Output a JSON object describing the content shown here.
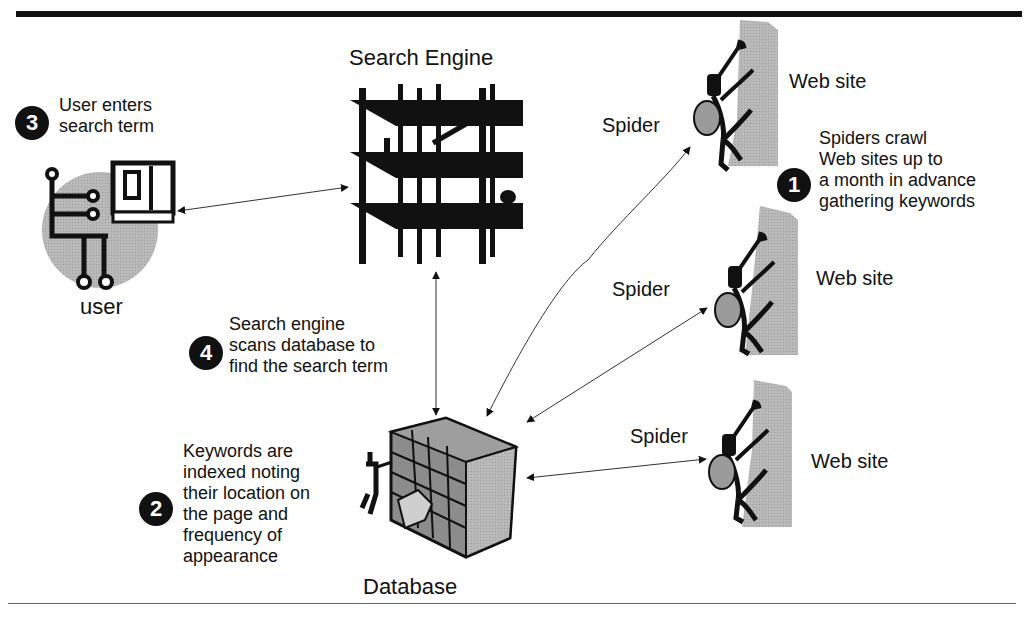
{
  "diagram": {
    "title_nodes": {
      "search_engine": "Search Engine",
      "user": "user",
      "database": "Database"
    },
    "websites": [
      {
        "site_label": "Web site",
        "spider_label": "Spider"
      },
      {
        "site_label": "Web site",
        "spider_label": "Spider"
      },
      {
        "site_label": "Web site",
        "spider_label": "Spider"
      }
    ],
    "steps": [
      {
        "number": "1",
        "lines": [
          "Spiders crawl",
          "Web sites up to",
          "a month in advance",
          "gathering keywords"
        ]
      },
      {
        "number": "2",
        "lines": [
          "Keywords are",
          "indexed noting",
          "their location on",
          "the page and",
          "frequency of",
          "appearance"
        ]
      },
      {
        "number": "3",
        "lines": [
          "User enters",
          "search term"
        ]
      },
      {
        "number": "4",
        "lines": [
          "Search engine",
          "scans database to",
          "find the search term"
        ]
      }
    ],
    "connections": [
      {
        "from": "user",
        "to": "search_engine",
        "type": "bidirectional"
      },
      {
        "from": "search_engine",
        "to": "database",
        "type": "bidirectional"
      },
      {
        "from": "database",
        "to": "spider_1",
        "type": "bidirectional"
      },
      {
        "from": "database",
        "to": "spider_2",
        "type": "bidirectional"
      },
      {
        "from": "database",
        "to": "spider_3",
        "type": "bidirectional"
      }
    ],
    "icons": {
      "user": "computer-user-icon",
      "search_engine": "building-under-construction-icon",
      "spider": "climber-icon",
      "website": "cliff-wall-icon",
      "database": "filing-cabinet-icon"
    },
    "colors": {
      "ink": "#111111",
      "gray_fill": "#a8a8a8",
      "light_gray": "#cfcfcf",
      "rule": "#666666"
    }
  }
}
